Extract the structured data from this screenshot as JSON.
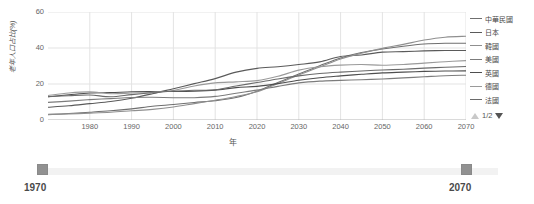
{
  "chart_data": {
    "type": "line",
    "title": "",
    "xlabel": "年",
    "ylabel": "老年人口占比(%)",
    "xlim": [
      1970,
      2070
    ],
    "ylim": [
      0,
      60
    ],
    "grid": true,
    "legend_position": "right",
    "x_ticks": [
      1980,
      1990,
      2000,
      2010,
      2020,
      2030,
      2040,
      2050,
      2060,
      2070
    ],
    "y_ticks": [
      0,
      20,
      40,
      60
    ],
    "x": [
      1970,
      1975,
      1980,
      1985,
      1990,
      1995,
      2000,
      2005,
      2010,
      2015,
      2020,
      2025,
      2030,
      2035,
      2040,
      2045,
      2050,
      2055,
      2060,
      2065,
      2070
    ],
    "series": [
      {
        "name": "中華民國",
        "color": "#6f6f6f",
        "values": [
          3.0,
          3.6,
          4.3,
          5.1,
          6.2,
          7.6,
          8.6,
          9.7,
          10.7,
          12.5,
          16.0,
          20.8,
          25.6,
          30.2,
          34.5,
          37.5,
          39.4,
          41.0,
          42.2,
          42.6,
          42.6
        ]
      },
      {
        "name": "日本",
        "color": "#5a5a5a",
        "values": [
          7.1,
          7.9,
          9.1,
          10.3,
          12.1,
          14.6,
          17.4,
          20.2,
          23.0,
          26.6,
          28.7,
          29.6,
          30.8,
          32.3,
          35.3,
          36.1,
          37.7,
          38.0,
          38.4,
          38.6,
          38.6
        ]
      },
      {
        "name": "韓國",
        "color": "#8f8f8f",
        "values": [
          3.1,
          3.4,
          3.8,
          4.3,
          5.1,
          5.9,
          7.2,
          9.1,
          11.0,
          13.1,
          15.7,
          20.3,
          25.0,
          29.4,
          33.9,
          37.1,
          39.8,
          42.0,
          44.4,
          46.0,
          46.5
        ]
      },
      {
        "name": "美國",
        "color": "#7c7c7c",
        "values": [
          9.8,
          10.5,
          11.3,
          11.9,
          12.5,
          12.6,
          12.4,
          12.4,
          13.1,
          14.9,
          16.6,
          18.7,
          20.6,
          21.6,
          22.0,
          22.4,
          22.8,
          23.4,
          24.0,
          24.6,
          24.9
        ]
      },
      {
        "name": "英國",
        "color": "#4e4e4e",
        "values": [
          12.9,
          14.0,
          15.0,
          15.2,
          15.7,
          15.8,
          15.8,
          16.0,
          16.6,
          18.0,
          18.7,
          20.2,
          22.1,
          23.5,
          24.5,
          25.4,
          26.2,
          26.6,
          27.0,
          27.2,
          27.3
        ]
      },
      {
        "name": "德國",
        "color": "#9a9a9a",
        "values": [
          13.6,
          15.0,
          15.6,
          14.6,
          15.0,
          15.4,
          16.4,
          18.9,
          20.6,
          21.2,
          21.9,
          24.3,
          27.7,
          29.6,
          30.5,
          30.8,
          30.4,
          30.8,
          31.6,
          32.4,
          33.0
        ]
      },
      {
        "name": "法國",
        "color": "#6a6a6a",
        "values": [
          12.9,
          13.5,
          13.9,
          12.9,
          14.1,
          15.1,
          16.1,
          16.5,
          16.8,
          18.9,
          20.8,
          22.8,
          24.5,
          25.8,
          26.6,
          27.2,
          27.8,
          28.2,
          28.8,
          29.3,
          29.7
        ]
      }
    ]
  },
  "legend": {
    "items": [
      {
        "label": "中華民國"
      },
      {
        "label": "日本"
      },
      {
        "label": "韓國"
      },
      {
        "label": "美國"
      },
      {
        "label": "英國"
      },
      {
        "label": "德國"
      },
      {
        "label": "法國"
      }
    ],
    "pager": {
      "text": "1/2",
      "up_icon": "triangle-up-icon",
      "down_icon": "triangle-down-icon"
    }
  },
  "range_slider": {
    "start_label": "1970",
    "end_label": "2070",
    "min": 1970,
    "max": 2070
  },
  "colors": {
    "grid": "#e3e3e3",
    "axis": "#cccccc",
    "text": "#666666",
    "handle": "#919191",
    "track": "#f2f2f2"
  }
}
